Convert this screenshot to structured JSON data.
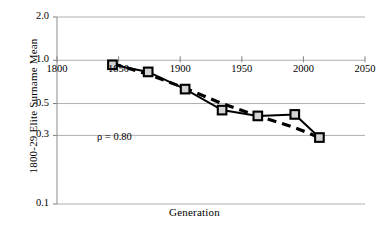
{
  "chart_data": {
    "type": "line",
    "title": "",
    "xlabel": "Generation",
    "ylabel": "1800-29 Elite Surname Mean",
    "yscale": "log",
    "xlim": [
      1800,
      2050
    ],
    "ylim": [
      0.1,
      2.0
    ],
    "grid": true,
    "legend": false,
    "xticks": [
      1800,
      1850,
      1900,
      1950,
      2000,
      2050
    ],
    "xticklabels": [
      "1800",
      "1850",
      "1900",
      "1950",
      "2000",
      "2050"
    ],
    "yticks": [
      2.0,
      1.0,
      0.5,
      0.3,
      0.1
    ],
    "yticklabels": [
      "2.0",
      "1.0",
      "0.5",
      "0.3",
      "0.1"
    ],
    "annotations": [
      {
        "name": "rho-annotation",
        "text": "ρ = 0.80",
        "x": 1865,
        "y": 0.39
      }
    ],
    "series": [
      {
        "name": "observed",
        "style": "solid",
        "marker": "square",
        "marker_fill": "#d4d4d4",
        "marker_edge": "#000000",
        "color": "#000000",
        "x": [
          1845,
          1874,
          1904,
          1934,
          1963,
          1993,
          2013
        ],
        "y": [
          0.93,
          0.83,
          0.63,
          0.45,
          0.41,
          0.42,
          0.29
        ]
      },
      {
        "name": "predicted",
        "style": "dashed",
        "marker": "none",
        "color": "#000000",
        "x": [
          1845,
          1874,
          1904,
          1934,
          1963,
          1993,
          2013
        ],
        "y": [
          0.95,
          0.8,
          0.64,
          0.5,
          0.41,
          0.34,
          0.29
        ]
      }
    ],
    "colors": {
      "line": "#000000",
      "grid": "#a6a6a6",
      "axis": "#808080",
      "marker_fill": "#d4d4d4",
      "background": "#ffffff"
    }
  }
}
